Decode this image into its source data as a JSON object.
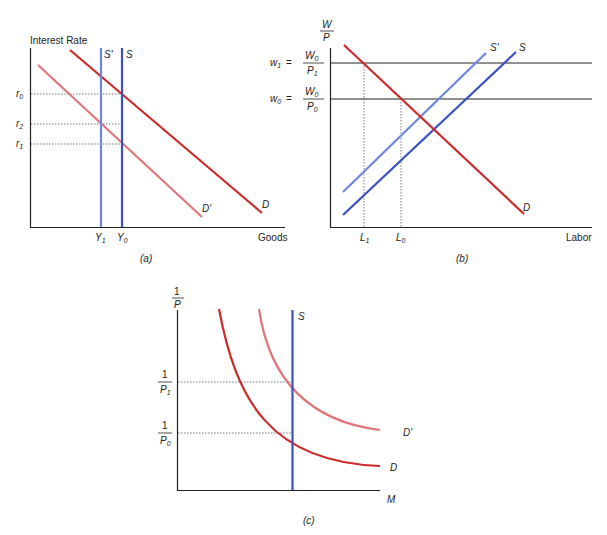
{
  "colors": {
    "demand": "#cc2a2a",
    "demand_shifted": "#e0767a",
    "supply": "#3a4fc4",
    "supply_shifted": "#6f86dc",
    "axis": "#222222",
    "guide": "#555555"
  },
  "panels": [
    {
      "id": "a",
      "caption": "(a)",
      "y_axis_label": "Interest Rate",
      "x_axis_label": "Goods",
      "y_ticks": [
        {
          "base": "r",
          "sub": "0"
        },
        {
          "base": "r",
          "sub": "2"
        },
        {
          "base": "r",
          "sub": "1"
        }
      ],
      "x_ticks": [
        {
          "base": "Y",
          "sub": "1"
        },
        {
          "base": "Y",
          "sub": "0"
        }
      ],
      "curves": {
        "S_prime": "S'",
        "S": "S",
        "D": "D",
        "D_prime": "D'"
      }
    },
    {
      "id": "b",
      "caption": "(b)",
      "y_axis_label_num": "W",
      "y_axis_label_den": "P",
      "x_axis_label": "Labor",
      "y_ticks": [
        {
          "lhs_base": "w",
          "lhs_sub": "1",
          "eq": "=",
          "num": "W",
          "num_sub": "0",
          "den": "P",
          "den_sub": "1"
        },
        {
          "lhs_base": "w",
          "lhs_sub": "0",
          "eq": "=",
          "num": "W",
          "num_sub": "0",
          "den": "P",
          "den_sub": "0"
        }
      ],
      "x_ticks": [
        {
          "base": "L",
          "sub": "1"
        },
        {
          "base": "L",
          "sub": "0"
        }
      ],
      "curves": {
        "S_prime": "S'",
        "S": "S",
        "D": "D"
      }
    },
    {
      "id": "c",
      "caption": "(c)",
      "y_axis_label_num": "1",
      "y_axis_label_den": "P",
      "x_axis_label": "M",
      "y_ticks": [
        {
          "num": "1",
          "den": "P",
          "den_sub": "1"
        },
        {
          "num": "1",
          "den": "P",
          "den_sub": "0"
        }
      ],
      "curves": {
        "S": "S",
        "D": "D",
        "D_prime": "D'"
      }
    }
  ]
}
